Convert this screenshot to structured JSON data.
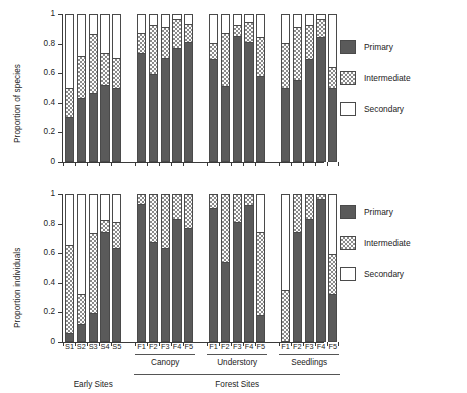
{
  "figure": {
    "background": "#ffffff",
    "colors": {
      "primary": "#5a5a5a",
      "intermediate_hatch": "#8a8a8a",
      "secondary": "#ffffff",
      "axis": "#3a3a3a"
    }
  },
  "legend": {
    "position": "right",
    "entries": [
      {
        "key": "primary",
        "label": "Primary"
      },
      {
        "key": "intermediate",
        "label": "Intermediate"
      },
      {
        "key": "secondary",
        "label": "Secondary"
      }
    ]
  },
  "axis_groups": {
    "site_brackets": [
      {
        "label": "Canopy"
      },
      {
        "label": "Understory"
      },
      {
        "label": "Seedlings"
      }
    ],
    "super_brackets": [
      {
        "label": "Early Sites"
      },
      {
        "label": "Forest Sites"
      }
    ]
  },
  "chart_data": [
    {
      "id": "top",
      "type": "bar",
      "stacked": true,
      "title": "",
      "xlabel": "",
      "ylabel": "Proportion of species",
      "ylim": [
        0,
        1
      ],
      "yticks": [
        0,
        0.2,
        0.4,
        0.6,
        0.8,
        1
      ],
      "ytick_labels": [
        "0",
        "0.2",
        "0.4",
        "0.6",
        "0.8",
        "1"
      ],
      "grid": false,
      "categories": [
        "S1",
        "S2",
        "S3",
        "S4",
        "S5",
        "F1",
        "F2",
        "F3",
        "F4",
        "F5",
        "F1",
        "F2",
        "F3",
        "F4",
        "F5",
        "F1",
        "F2",
        "F3",
        "F4",
        "F5"
      ],
      "groups": [
        "Early Sites",
        "Early Sites",
        "Early Sites",
        "Early Sites",
        "Early Sites",
        "Canopy",
        "Canopy",
        "Canopy",
        "Canopy",
        "Canopy",
        "Understory",
        "Understory",
        "Understory",
        "Understory",
        "Understory",
        "Seedlings",
        "Seedlings",
        "Seedlings",
        "Seedlings",
        "Seedlings"
      ],
      "series": [
        {
          "name": "Primary",
          "values": [
            0.31,
            0.44,
            0.47,
            0.53,
            0.51,
            0.74,
            0.6,
            0.71,
            0.78,
            0.82,
            0.7,
            0.52,
            0.86,
            0.82,
            0.59,
            0.51,
            0.56,
            0.7,
            0.85,
            0.51
          ]
        },
        {
          "name": "Intermediate",
          "values": [
            0.2,
            0.28,
            0.4,
            0.21,
            0.2,
            0.14,
            0.33,
            0.21,
            0.19,
            0.12,
            0.11,
            0.36,
            0.07,
            0.13,
            0.26,
            0.3,
            0.36,
            0.23,
            0.12,
            0.14
          ]
        },
        {
          "name": "Secondary",
          "values": [
            0.49,
            0.28,
            0.13,
            0.26,
            0.29,
            0.12,
            0.07,
            0.08,
            0.03,
            0.06,
            0.19,
            0.12,
            0.07,
            0.05,
            0.15,
            0.19,
            0.08,
            0.07,
            0.03,
            0.35
          ]
        }
      ]
    },
    {
      "id": "bottom",
      "type": "bar",
      "stacked": true,
      "title": "",
      "xlabel": "",
      "ylabel": "Proportion individuals",
      "ylim": [
        0,
        1
      ],
      "yticks": [
        0,
        0.2,
        0.4,
        0.6,
        0.8,
        1
      ],
      "ytick_labels": [
        "0",
        "0.2",
        "0.4",
        "0.6",
        "0.8",
        "1"
      ],
      "grid": false,
      "categories": [
        "S1",
        "S2",
        "S3",
        "S4",
        "S5",
        "F1",
        "F2",
        "F3",
        "F4",
        "F5",
        "F1",
        "F2",
        "F3",
        "F4",
        "F5",
        "F1",
        "F2",
        "F3",
        "F4",
        "F5"
      ],
      "groups": [
        "Early Sites",
        "Early Sites",
        "Early Sites",
        "Early Sites",
        "Early Sites",
        "Canopy",
        "Canopy",
        "Canopy",
        "Canopy",
        "Canopy",
        "Understory",
        "Understory",
        "Understory",
        "Understory",
        "Understory",
        "Seedlings",
        "Seedlings",
        "Seedlings",
        "Seedlings",
        "Seedlings"
      ],
      "series": [
        {
          "name": "Primary",
          "values": [
            0.07,
            0.13,
            0.2,
            0.75,
            0.64,
            0.94,
            0.68,
            0.64,
            0.84,
            0.78,
            0.91,
            0.55,
            0.82,
            0.93,
            0.19,
            0.0,
            0.75,
            0.84,
            0.97,
            0.33
          ]
        },
        {
          "name": "Intermediate",
          "values": [
            0.59,
            0.2,
            0.54,
            0.08,
            0.18,
            0.06,
            0.32,
            0.36,
            0.16,
            0.22,
            0.09,
            0.45,
            0.18,
            0.07,
            0.56,
            0.36,
            0.25,
            0.16,
            0.03,
            0.27
          ]
        },
        {
          "name": "Secondary",
          "values": [
            0.34,
            0.67,
            0.26,
            0.17,
            0.18,
            0.0,
            0.0,
            0.0,
            0.0,
            0.0,
            0.0,
            0.0,
            0.0,
            0.0,
            0.25,
            0.64,
            0.0,
            0.0,
            0.0,
            0.4
          ]
        }
      ]
    }
  ]
}
